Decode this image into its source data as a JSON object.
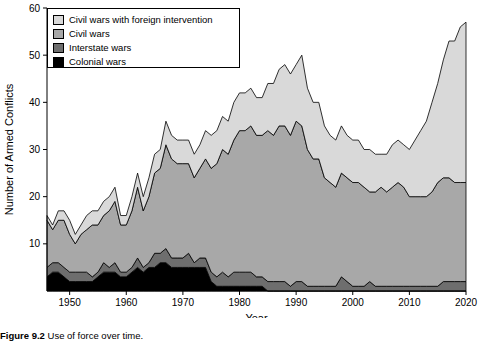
{
  "caption": {
    "figure_number": "Figure 9.2",
    "text": "Use of force over time."
  },
  "legend": {
    "items": [
      {
        "label": "Civil wars with foreign intervention",
        "color": "#d9d9d9"
      },
      {
        "label": "Civil wars",
        "color": "#a8a8a8"
      },
      {
        "label": "Interstate wars",
        "color": "#6e6e6e"
      },
      {
        "label": "Colonial wars",
        "color": "#000000"
      }
    ]
  },
  "chart_data": {
    "type": "area",
    "title": "",
    "xlabel": "Year",
    "ylabel": "Number of Armed Conflicts",
    "xlim": [
      1946,
      2020
    ],
    "ylim": [
      0,
      60
    ],
    "xticks": [
      1950,
      1960,
      1970,
      1980,
      1990,
      2000,
      2010,
      2020
    ],
    "yticks": [
      10,
      20,
      30,
      40,
      50,
      60
    ],
    "grid": false,
    "legend_position": "top-left",
    "stacked": true,
    "x": [
      1946,
      1947,
      1948,
      1949,
      1950,
      1951,
      1952,
      1953,
      1954,
      1955,
      1956,
      1957,
      1958,
      1959,
      1960,
      1961,
      1962,
      1963,
      1964,
      1965,
      1966,
      1967,
      1968,
      1969,
      1970,
      1971,
      1972,
      1973,
      1974,
      1975,
      1976,
      1977,
      1978,
      1979,
      1980,
      1981,
      1982,
      1983,
      1984,
      1985,
      1986,
      1987,
      1988,
      1989,
      1990,
      1991,
      1992,
      1993,
      1994,
      1995,
      1996,
      1997,
      1998,
      1999,
      2000,
      2001,
      2002,
      2003,
      2004,
      2005,
      2006,
      2007,
      2008,
      2009,
      2010,
      2011,
      2012,
      2013,
      2014,
      2015,
      2016,
      2017,
      2018,
      2019,
      2020
    ],
    "series": [
      {
        "name": "Colonial wars",
        "color": "#000000",
        "values": [
          3,
          4,
          4,
          3,
          2,
          2,
          2,
          2,
          2,
          3,
          4,
          4,
          4,
          3,
          3,
          4,
          5,
          4,
          5,
          5,
          6,
          6,
          5,
          5,
          5,
          5,
          5,
          5,
          5,
          2,
          1,
          1,
          1,
          1,
          1,
          1,
          1,
          1,
          1,
          0,
          0,
          0,
          0,
          0,
          0,
          0,
          0,
          0,
          0,
          0,
          0,
          0,
          0,
          0,
          0,
          0,
          0,
          0,
          0,
          0,
          0,
          0,
          0,
          0,
          0,
          0,
          0,
          0,
          0,
          0,
          0,
          0,
          0,
          0,
          0
        ]
      },
      {
        "name": "Interstate wars",
        "color": "#6e6e6e",
        "values": [
          2,
          2,
          2,
          2,
          2,
          2,
          2,
          2,
          1,
          1,
          2,
          1,
          2,
          1,
          1,
          1,
          2,
          1,
          1,
          3,
          2,
          3,
          2,
          2,
          2,
          3,
          1,
          2,
          2,
          2,
          2,
          3,
          2,
          3,
          3,
          3,
          3,
          2,
          2,
          2,
          2,
          2,
          2,
          1,
          2,
          2,
          1,
          1,
          1,
          1,
          1,
          1,
          3,
          2,
          1,
          1,
          1,
          2,
          1,
          1,
          1,
          1,
          1,
          1,
          1,
          1,
          1,
          1,
          1,
          1,
          2,
          2,
          2,
          2,
          2
        ]
      },
      {
        "name": "Civil wars",
        "color": "#a8a8a8",
        "values": [
          10,
          7,
          9,
          10,
          8,
          6,
          8,
          9,
          11,
          10,
          10,
          12,
          13,
          10,
          10,
          12,
          15,
          12,
          14,
          17,
          18,
          22,
          21,
          20,
          20,
          19,
          18,
          19,
          21,
          22,
          24,
          26,
          26,
          28,
          30,
          30,
          31,
          30,
          30,
          32,
          31,
          33,
          33,
          32,
          34,
          33,
          29,
          27,
          27,
          23,
          22,
          21,
          22,
          22,
          22,
          22,
          21,
          19,
          20,
          21,
          20,
          21,
          22,
          21,
          19,
          19,
          19,
          19,
          20,
          22,
          22,
          22,
          21,
          21,
          21
        ]
      },
      {
        "name": "Civil wars with foreign intervention",
        "color": "#d9d9d9",
        "values": [
          1,
          1,
          2,
          2,
          3,
          2,
          2,
          3,
          3,
          3,
          3,
          3,
          3,
          2,
          2,
          3,
          3,
          3,
          4,
          4,
          4,
          5,
          5,
          5,
          5,
          5,
          5,
          5,
          6,
          7,
          7,
          7,
          7,
          8,
          8,
          8,
          8,
          8,
          8,
          10,
          11,
          12,
          13,
          13,
          12,
          15,
          13,
          12,
          12,
          11,
          10,
          10,
          10,
          9,
          9,
          9,
          8,
          9,
          8,
          7,
          8,
          9,
          9,
          9,
          10,
          12,
          14,
          16,
          19,
          21,
          25,
          29,
          30,
          33,
          34
        ]
      }
    ]
  }
}
